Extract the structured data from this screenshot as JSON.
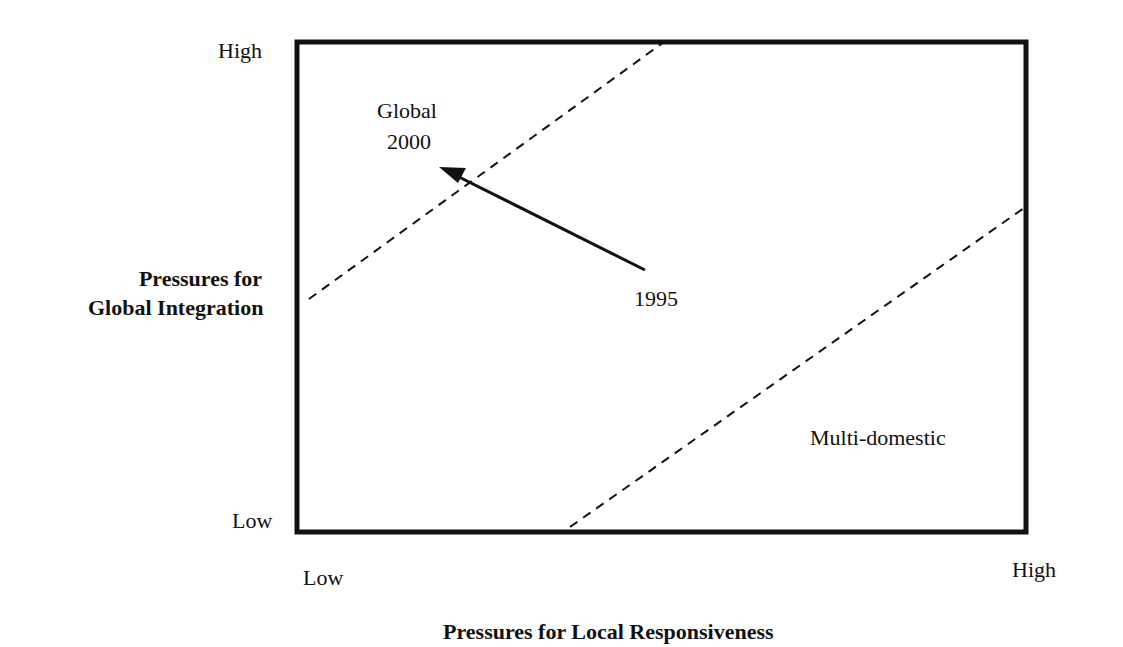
{
  "diagram": {
    "type": "integration-responsiveness grid",
    "y_axis": {
      "title_line1": "Pressures for",
      "title_line2": "Global Integration",
      "high_label": "High",
      "low_label": "Low"
    },
    "x_axis": {
      "title": "Pressures for Local Responsiveness",
      "low_label": "Low",
      "high_label": "High"
    },
    "regions": {
      "global": "Global",
      "multidomestic": "Multi-domestic"
    },
    "movement": {
      "from_label": "1995",
      "to_label": "2000"
    },
    "colors": {
      "line": "#111111",
      "background": "#ffffff"
    }
  }
}
